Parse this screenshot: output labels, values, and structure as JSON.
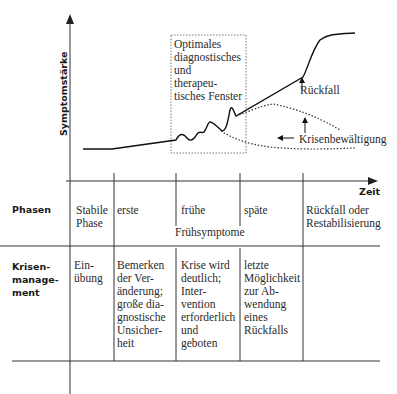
{
  "diagram": {
    "y_axis_label": "Symptomstärke",
    "x_axis_label": "Zeit",
    "window_label": [
      "Optimales",
      "diagnostisches",
      "und",
      "therapeu-",
      "tisches Fenster"
    ],
    "annotations": {
      "relapse": "Rückfall",
      "crisis_management": "Krisenbewältigung"
    }
  },
  "table": {
    "phases": {
      "row_label": "Phasen",
      "cells": [
        "Stabile Phase",
        "erste",
        "frühe",
        "späte",
        "Rückfall oder Restabilisierung"
      ],
      "span_label": "Frühsymptome"
    },
    "crisis": {
      "row_label_lines": [
        "Krisen-",
        "manage-",
        "ment"
      ],
      "cells": [
        [
          "Ein-",
          "übung"
        ],
        [
          "Bemerken",
          "der Ver-",
          "änderung;",
          "große dia-",
          "gnostische",
          "Unsicher-",
          "heit"
        ],
        [
          "Krise wird",
          "deutlich;",
          "Inter-",
          "vention",
          "erforderlich",
          "und",
          "geboten"
        ],
        [
          "letzte",
          "Möglichkeit",
          "zur Ab-",
          "wendung",
          "eines",
          "Rückfalls"
        ],
        []
      ]
    }
  }
}
